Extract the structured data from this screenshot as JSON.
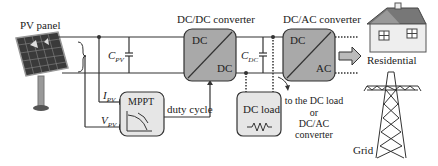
{
  "components": {
    "pv_panel": {
      "label": "PV panel"
    },
    "dcdc": {
      "title": "DC/DC converter",
      "in": "DC",
      "out": "DC"
    },
    "dcac": {
      "title": "DC/AC converter",
      "in": "DC",
      "out": "AC"
    },
    "mppt": {
      "label": "MPPT"
    },
    "dc_load": {
      "label": "DC load"
    },
    "residential": {
      "label": "Residential"
    },
    "grid": {
      "label": "Grid"
    }
  },
  "signals": {
    "c_pv": "C",
    "c_pv_sub": "PV",
    "c_dc": "C",
    "c_dc_sub": "DC",
    "i_pv": "I",
    "i_pv_sub": "PV",
    "v_pv": "V",
    "v_pv_sub": "PV",
    "duty_cycle": "duty cycle"
  },
  "annotation": {
    "line1": "to the DC load",
    "line2": "or",
    "line3": "DC/AC",
    "line4": "converter"
  },
  "colors": {
    "block_fill": "#a9a9a9",
    "light_block_fill": "#e6e6e6",
    "line": "#333333"
  }
}
